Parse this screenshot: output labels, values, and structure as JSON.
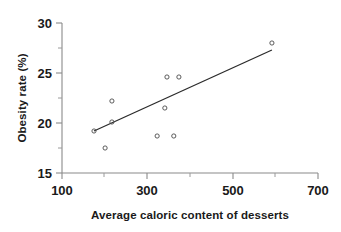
{
  "chart_data": {
    "type": "scatter",
    "title": "",
    "xlabel": "Average caloric content of desserts",
    "ylabel": "Obesity rate (%)",
    "xlim": [
      100,
      700
    ],
    "ylim": [
      15,
      30
    ],
    "x_ticks": [
      100,
      300,
      500,
      700
    ],
    "x_tick_labels": [
      "100",
      "300",
      "500",
      "700"
    ],
    "x_minor_ticks": [
      200,
      400,
      600
    ],
    "y_ticks": [
      15,
      20,
      25,
      30
    ],
    "y_tick_labels": [
      "15",
      "20",
      "25",
      "30"
    ],
    "y_minor_ticks": [
      17.5,
      22.5,
      27.5
    ],
    "grid": false,
    "legend": null,
    "marker_style": "open-circle",
    "points": [
      {
        "x": 175,
        "y": 19.2
      },
      {
        "x": 201,
        "y": 17.5
      },
      {
        "x": 217,
        "y": 22.2
      },
      {
        "x": 217,
        "y": 20.1
      },
      {
        "x": 323,
        "y": 18.7
      },
      {
        "x": 341,
        "y": 21.5
      },
      {
        "x": 346,
        "y": 24.6
      },
      {
        "x": 362,
        "y": 18.7
      },
      {
        "x": 374,
        "y": 24.6
      },
      {
        "x": 592,
        "y": 28.0
      }
    ],
    "trend_line": {
      "type": "linear-fit",
      "x_start": 175,
      "y_start": 19.2,
      "x_end": 592,
      "y_end": 27.3
    },
    "colors": {
      "axis": "#8a8a8a",
      "marker": "#4a4a4a",
      "trend": "#2b2b2b",
      "text": "#1a1a1a",
      "background": "#ffffff"
    }
  },
  "axis": {
    "x_title": "Average caloric content of desserts",
    "y_title": "Obesity rate (%)",
    "x_labels": [
      "100",
      "300",
      "500",
      "700"
    ],
    "y_labels": [
      "30",
      "25",
      "20",
      "15"
    ]
  }
}
